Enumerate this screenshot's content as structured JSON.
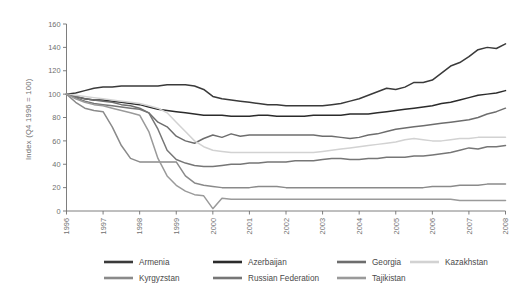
{
  "chart_data": {
    "type": "line",
    "title": "",
    "subtitle": "",
    "xlabel": "",
    "ylabel": "Index (Q4 1996 = 100)",
    "xlim": [
      1996,
      2008
    ],
    "ylim": [
      0,
      160
    ],
    "ytick_step": 20,
    "yticks": [
      0,
      20,
      40,
      60,
      80,
      100,
      120,
      140,
      160
    ],
    "xticks": [
      1996,
      1997,
      1998,
      1999,
      2000,
      2001,
      2002,
      2003,
      2004,
      2005,
      2006,
      2007,
      2008
    ],
    "xtick_labels": [
      "1996",
      "1997",
      "1998",
      "1999",
      "2000",
      "2001",
      "2002",
      "2003",
      "2004",
      "2005",
      "2006",
      "2007",
      "2008"
    ],
    "grid": false,
    "legend_position": "bottom",
    "x_unit": "quarter",
    "series": [
      {
        "name": "Armenia",
        "color": "#3a3a3a",
        "x": [
          1996.0,
          1996.25,
          1996.5,
          1996.75,
          1997.0,
          1997.25,
          1997.5,
          1997.75,
          1998.0,
          1998.25,
          1998.5,
          1998.75,
          1999.0,
          1999.25,
          1999.5,
          1999.75,
          2000.0,
          2000.25,
          2000.5,
          2000.75,
          2001.0,
          2001.25,
          2001.5,
          2001.75,
          2002.0,
          2002.25,
          2002.5,
          2002.75,
          2003.0,
          2003.25,
          2003.5,
          2003.75,
          2004.0,
          2004.25,
          2004.5,
          2004.75,
          2005.0,
          2005.25,
          2005.5,
          2005.75,
          2006.0,
          2006.25,
          2006.5,
          2006.75,
          2007.0,
          2007.25,
          2007.5,
          2007.75,
          2008.0
        ],
        "values": [
          100,
          101,
          103,
          105,
          106,
          106,
          107,
          107,
          107,
          107,
          107,
          108,
          108,
          108,
          107,
          104,
          98,
          96,
          95,
          94,
          93,
          92,
          91,
          91,
          90,
          90,
          90,
          90,
          90,
          91,
          92,
          94,
          96,
          99,
          102,
          105,
          104,
          106,
          110,
          110,
          112,
          118,
          124,
          127,
          132,
          138,
          140,
          139,
          143
        ]
      },
      {
        "name": "Azerbaijan",
        "color": "#2b2b2b",
        "x": [
          1996.0,
          1996.25,
          1996.5,
          1996.75,
          1997.0,
          1997.25,
          1997.5,
          1997.75,
          1998.0,
          1998.25,
          1998.5,
          1998.75,
          1999.0,
          1999.25,
          1999.5,
          1999.75,
          2000.0,
          2000.25,
          2000.5,
          2000.75,
          2001.0,
          2001.25,
          2001.5,
          2001.75,
          2002.0,
          2002.25,
          2002.5,
          2002.75,
          2003.0,
          2003.25,
          2003.5,
          2003.75,
          2004.0,
          2004.25,
          2004.5,
          2004.75,
          2005.0,
          2005.25,
          2005.5,
          2005.75,
          2006.0,
          2006.25,
          2006.5,
          2006.75,
          2007.0,
          2007.25,
          2007.5,
          2007.75,
          2008.0
        ],
        "values": [
          100,
          98,
          96,
          95,
          95,
          94,
          93,
          92,
          91,
          89,
          87,
          86,
          85,
          84,
          83,
          82,
          82,
          82,
          81,
          81,
          81,
          82,
          82,
          81,
          81,
          81,
          81,
          82,
          82,
          82,
          82,
          83,
          83,
          83,
          84,
          85,
          86,
          87,
          88,
          89,
          90,
          92,
          93,
          95,
          97,
          99,
          100,
          101,
          103
        ]
      },
      {
        "name": "Georgia",
        "color": "#6d6d6d",
        "x": [
          1996.0,
          1996.25,
          1996.5,
          1996.75,
          1997.0,
          1997.25,
          1997.5,
          1997.75,
          1998.0,
          1998.25,
          1998.5,
          1998.75,
          1999.0,
          1999.25,
          1999.5,
          1999.75,
          2000.0,
          2000.25,
          2000.5,
          2000.75,
          2001.0,
          2001.25,
          2001.5,
          2001.75,
          2002.0,
          2002.25,
          2002.5,
          2002.75,
          2003.0,
          2003.25,
          2003.5,
          2003.75,
          2004.0,
          2004.25,
          2004.5,
          2004.75,
          2005.0,
          2005.25,
          2005.5,
          2005.75,
          2006.0,
          2006.25,
          2006.5,
          2006.75,
          2007.0,
          2007.25,
          2007.5,
          2007.75,
          2008.0
        ],
        "values": [
          100,
          98,
          96,
          95,
          94,
          93,
          91,
          90,
          88,
          84,
          76,
          72,
          64,
          60,
          58,
          62,
          65,
          63,
          66,
          64,
          65,
          65,
          65,
          65,
          65,
          65,
          65,
          65,
          64,
          64,
          63,
          62,
          63,
          65,
          66,
          68,
          70,
          71,
          72,
          73,
          74,
          75,
          76,
          77,
          78,
          80,
          83,
          85,
          88
        ]
      },
      {
        "name": "Kazakhstan",
        "color": "#d2d2d2",
        "x": [
          1996.0,
          1996.25,
          1996.5,
          1996.75,
          1997.0,
          1997.25,
          1997.5,
          1997.75,
          1998.0,
          1998.25,
          1998.5,
          1998.75,
          1999.0,
          1999.25,
          1999.5,
          1999.75,
          2000.0,
          2000.25,
          2000.5,
          2000.75,
          2001.0,
          2001.25,
          2001.5,
          2001.75,
          2002.0,
          2002.25,
          2002.5,
          2002.75,
          2003.0,
          2003.25,
          2003.5,
          2003.75,
          2004.0,
          2004.25,
          2004.5,
          2004.75,
          2005.0,
          2005.25,
          2005.5,
          2005.75,
          2006.0,
          2006.25,
          2006.5,
          2006.75,
          2007.0,
          2007.25,
          2007.5,
          2007.75,
          2008.0
        ],
        "values": [
          100,
          99,
          98,
          97,
          96,
          95,
          94,
          93,
          92,
          90,
          88,
          84,
          76,
          68,
          60,
          55,
          52,
          51,
          50,
          50,
          50,
          50,
          50,
          50,
          50,
          50,
          50,
          50,
          51,
          52,
          53,
          54,
          55,
          56,
          57,
          58,
          59,
          61,
          62,
          61,
          60,
          60,
          61,
          62,
          62,
          63,
          63,
          63,
          63
        ]
      },
      {
        "name": "Kyrgyzstan",
        "color": "#8a8a8a",
        "x": [
          1996.0,
          1996.25,
          1996.5,
          1996.75,
          1997.0,
          1997.25,
          1997.5,
          1997.75,
          1998.0,
          1998.25,
          1998.5,
          1998.75,
          1999.0,
          1999.25,
          1999.5,
          1999.75,
          2000.0,
          2000.25,
          2000.5,
          2000.75,
          2001.0,
          2001.25,
          2001.5,
          2001.75,
          2002.0,
          2002.25,
          2002.5,
          2002.75,
          2003.0,
          2003.25,
          2003.5,
          2003.75,
          2004.0,
          2004.25,
          2004.5,
          2004.75,
          2005.0,
          2005.25,
          2005.5,
          2005.75,
          2006.0,
          2006.25,
          2006.5,
          2006.75,
          2007.0,
          2007.25,
          2007.5,
          2007.75,
          2008.0
        ],
        "values": [
          100,
          93,
          88,
          86,
          85,
          72,
          56,
          45,
          42,
          42,
          42,
          42,
          42,
          30,
          24,
          22,
          21,
          20,
          20,
          20,
          20,
          21,
          21,
          21,
          20,
          20,
          20,
          20,
          20,
          20,
          20,
          20,
          20,
          20,
          20,
          20,
          20,
          20,
          20,
          20,
          21,
          21,
          21,
          22,
          22,
          22,
          23,
          23,
          23
        ]
      },
      {
        "name": "Russian Federation",
        "color": "#767676",
        "x": [
          1996.0,
          1996.25,
          1996.5,
          1996.75,
          1997.0,
          1997.25,
          1997.5,
          1997.75,
          1998.0,
          1998.25,
          1998.5,
          1998.75,
          1999.0,
          1999.25,
          1999.5,
          1999.75,
          2000.0,
          2000.25,
          2000.5,
          2000.75,
          2001.0,
          2001.25,
          2001.5,
          2001.75,
          2002.0,
          2002.25,
          2002.5,
          2002.75,
          2003.0,
          2003.25,
          2003.5,
          2003.75,
          2004.0,
          2004.25,
          2004.5,
          2004.75,
          2005.0,
          2005.25,
          2005.5,
          2005.75,
          2006.0,
          2006.25,
          2006.5,
          2006.75,
          2007.0,
          2007.25,
          2007.5,
          2007.75,
          2008.0
        ],
        "values": [
          100,
          97,
          94,
          92,
          91,
          90,
          89,
          88,
          87,
          84,
          70,
          52,
          44,
          41,
          39,
          38,
          38,
          39,
          40,
          40,
          41,
          41,
          42,
          42,
          42,
          43,
          43,
          43,
          44,
          45,
          45,
          44,
          44,
          45,
          45,
          46,
          46,
          46,
          47,
          47,
          48,
          49,
          50,
          52,
          54,
          53,
          55,
          55,
          56
        ]
      },
      {
        "name": "Tajikistan",
        "color": "#9a9a9a",
        "x": [
          1996.0,
          1996.25,
          1996.5,
          1996.75,
          1997.0,
          1997.25,
          1997.5,
          1997.75,
          1998.0,
          1998.25,
          1998.5,
          1998.75,
          1999.0,
          1999.25,
          1999.5,
          1999.75,
          2000.0,
          2000.25,
          2000.5,
          2000.75,
          2001.0,
          2001.25,
          2001.5,
          2001.75,
          2002.0,
          2002.25,
          2002.5,
          2002.75,
          2003.0,
          2003.25,
          2003.5,
          2003.75,
          2004.0,
          2004.25,
          2004.5,
          2004.75,
          2005.0,
          2005.25,
          2005.5,
          2005.75,
          2006.0,
          2006.25,
          2006.5,
          2006.75,
          2007.0,
          2007.25,
          2007.5,
          2007.75,
          2008.0
        ],
        "values": [
          100,
          96,
          93,
          91,
          90,
          88,
          86,
          84,
          82,
          68,
          45,
          30,
          22,
          17,
          14,
          13,
          2,
          11,
          10,
          10,
          10,
          10,
          10,
          10,
          10,
          10,
          10,
          10,
          10,
          10,
          10,
          10,
          10,
          10,
          10,
          10,
          10,
          10,
          10,
          10,
          10,
          10,
          10,
          9,
          9,
          9,
          9,
          9,
          9
        ]
      }
    ]
  },
  "legend": {
    "entries": [
      {
        "label": "Armenia",
        "color": "#3a3a3a"
      },
      {
        "label": "Azerbaijan",
        "color": "#2b2b2b"
      },
      {
        "label": "Georgia",
        "color": "#6d6d6d"
      },
      {
        "label": "Kazakhstan",
        "color": "#d2d2d2"
      },
      {
        "label": "Kyrgyzstan",
        "color": "#8a8a8a"
      },
      {
        "label": "Russian Federation",
        "color": "#767676"
      },
      {
        "label": "Tajikistan",
        "color": "#9a9a9a"
      }
    ]
  },
  "axes": {
    "y_axis_title": "Index (Q4 1996 = 100)",
    "y_tick_labels": [
      "0",
      "20",
      "40",
      "60",
      "80",
      "100",
      "120",
      "140",
      "160"
    ],
    "x_tick_labels": [
      "1996",
      "1997",
      "1998",
      "1999",
      "2000",
      "2001",
      "2002",
      "2003",
      "2004",
      "2005",
      "2006",
      "2007",
      "2008"
    ]
  },
  "style": {
    "background": "#ffffff",
    "axis_color": "#6f6f6f",
    "tick_label_color": "#6f6f6f",
    "legend_text_color": "#4a4a4a"
  }
}
